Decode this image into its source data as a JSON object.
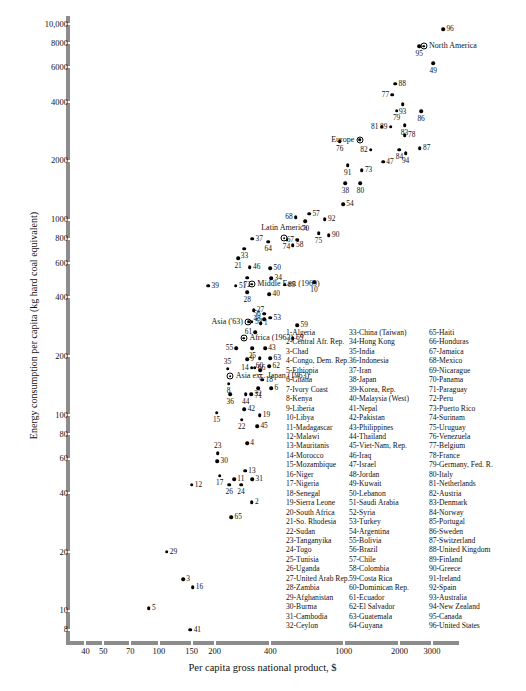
{
  "chart_data": {
    "type": "scatter",
    "title": "",
    "xlabel": "Per capita gross national product, $",
    "ylabel": "Energy consumption per capita (kg hard coal equivalent)",
    "xscale": "log",
    "yscale": "log",
    "xlim": [
      33,
      4200
    ],
    "ylim": [
      7,
      11000
    ],
    "grid": false,
    "legend_position": "inside-lower-right",
    "x_ticks": [
      40,
      50,
      70,
      100,
      150,
      200,
      400,
      1000,
      2000,
      3000
    ],
    "x_tick_labels": [
      "40",
      "50",
      "70",
      "100",
      "150",
      "200",
      "400",
      "1000",
      "2000",
      "3000"
    ],
    "y_ticks": [
      8,
      10,
      20,
      40,
      60,
      80,
      100,
      200,
      400,
      600,
      800,
      1000,
      2000,
      4000,
      6000,
      8000,
      10000
    ],
    "y_tick_labels": [
      "8",
      "10",
      "20",
      "40",
      "60",
      "80",
      "100",
      "200",
      "400",
      "600",
      "800",
      "1000",
      "2000",
      "4000",
      "6000",
      "8000",
      "10,000"
    ],
    "points": [
      {
        "id": "96",
        "x": 3450,
        "y": 9400,
        "lx": "right"
      },
      {
        "id": "95",
        "x": 2560,
        "y": 7700,
        "lx": "below"
      },
      {
        "id": "49",
        "x": 3050,
        "y": 6300,
        "lx": "below"
      },
      {
        "id": "88",
        "x": 1900,
        "y": 4950,
        "lx": "right"
      },
      {
        "id": "77",
        "x": 1830,
        "y": 4350,
        "lx": "left"
      },
      {
        "id": "93",
        "x": 2080,
        "y": 3900,
        "lx": "below"
      },
      {
        "id": "79",
        "x": 1930,
        "y": 3600,
        "lx": "below"
      },
      {
        "id": "86",
        "x": 2620,
        "y": 3580,
        "lx": "below"
      },
      {
        "id": "83",
        "x": 2130,
        "y": 3050,
        "lx": "below"
      },
      {
        "id": "89",
        "x": 1790,
        "y": 2980,
        "lx": "left"
      },
      {
        "id": "81",
        "x": 1600,
        "y": 2980,
        "lx": "left"
      },
      {
        "id": "78",
        "x": 2140,
        "y": 2700,
        "lx": "right"
      },
      {
        "id": "76",
        "x": 950,
        "y": 2520,
        "lx": "below"
      },
      {
        "id": "87",
        "x": 2580,
        "y": 2320,
        "lx": "right"
      },
      {
        "id": "82",
        "x": 1400,
        "y": 2280,
        "lx": "left"
      },
      {
        "id": "84",
        "x": 2000,
        "y": 2280,
        "lx": "below"
      },
      {
        "id": "94",
        "x": 2160,
        "y": 2180,
        "lx": "below"
      },
      {
        "id": "47",
        "x": 1630,
        "y": 1980,
        "lx": "right"
      },
      {
        "id": "91",
        "x": 1050,
        "y": 1900,
        "lx": "below"
      },
      {
        "id": "73",
        "x": 1250,
        "y": 1790,
        "lx": "right"
      },
      {
        "id": "38",
        "x": 1020,
        "y": 1540,
        "lx": "below"
      },
      {
        "id": "80",
        "x": 1230,
        "y": 1540,
        "lx": "below"
      },
      {
        "id": "54",
        "x": 990,
        "y": 1200,
        "lx": "right"
      },
      {
        "id": "68",
        "x": 550,
        "y": 1030,
        "lx": "left"
      },
      {
        "id": "57",
        "x": 650,
        "y": 1070,
        "lx": "right"
      },
      {
        "id": "70",
        "x": 620,
        "y": 985,
        "lx": "below"
      },
      {
        "id": "92",
        "x": 790,
        "y": 1005,
        "lx": "right"
      },
      {
        "id": "75",
        "x": 730,
        "y": 855,
        "lx": "below"
      },
      {
        "id": "90",
        "x": 830,
        "y": 835,
        "lx": "right"
      },
      {
        "id": "67",
        "x": 560,
        "y": 790,
        "lx": "left"
      },
      {
        "id": "74",
        "x": 490,
        "y": 790,
        "lx": "below"
      },
      {
        "id": "37",
        "x": 320,
        "y": 800,
        "lx": "right"
      },
      {
        "id": "64",
        "x": 390,
        "y": 770,
        "lx": "below"
      },
      {
        "id": "58",
        "x": 530,
        "y": 740,
        "lx": "right"
      },
      {
        "id": "33",
        "x": 290,
        "y": 710,
        "lx": "below"
      },
      {
        "id": "21",
        "x": 268,
        "y": 635,
        "lx": "below"
      },
      {
        "id": "46",
        "x": 310,
        "y": 570,
        "lx": "right"
      },
      {
        "id": "50",
        "x": 400,
        "y": 565,
        "lx": "right"
      },
      {
        "id": "72",
        "x": 300,
        "y": 505,
        "lx": "below"
      },
      {
        "id": "34",
        "x": 405,
        "y": 500,
        "lx": "right"
      },
      {
        "id": "85",
        "x": 480,
        "y": 465,
        "lx": "right"
      },
      {
        "id": "10",
        "x": 690,
        "y": 480,
        "lx": "below"
      },
      {
        "id": "39",
        "x": 185,
        "y": 460,
        "lx": "right"
      },
      {
        "id": "51",
        "x": 260,
        "y": 460,
        "lx": "right"
      },
      {
        "id": "28",
        "x": 300,
        "y": 425,
        "lx": "below"
      },
      {
        "id": "40",
        "x": 395,
        "y": 415,
        "lx": "right"
      },
      {
        "id": "27",
        "x": 325,
        "y": 345,
        "lx": "right"
      },
      {
        "id": "56",
        "x": 370,
        "y": 330,
        "lx": "left"
      },
      {
        "id": "53",
        "x": 400,
        "y": 315,
        "lx": "right"
      },
      {
        "id": "48",
        "x": 370,
        "y": 310,
        "lx": "left"
      },
      {
        "id": "52",
        "x": 318,
        "y": 300,
        "lx": "right"
      },
      {
        "id": "1",
        "x": 355,
        "y": 296,
        "lx": "right"
      },
      {
        "id": "59",
        "x": 560,
        "y": 288,
        "lx": "right"
      },
      {
        "id": "61",
        "x": 332,
        "y": 265,
        "lx": "left"
      },
      {
        "id": "69",
        "x": 530,
        "y": 248,
        "lx": "right"
      },
      {
        "id": "55",
        "x": 262,
        "y": 220,
        "lx": "left"
      },
      {
        "id": "25",
        "x": 320,
        "y": 220,
        "lx": "below"
      },
      {
        "id": "43",
        "x": 375,
        "y": 220,
        "lx": "right"
      },
      {
        "id": "60",
        "x": 350,
        "y": 196,
        "lx": "below"
      },
      {
        "id": "63",
        "x": 400,
        "y": 196,
        "lx": "right"
      },
      {
        "id": "9",
        "x": 300,
        "y": 193,
        "lx": "right"
      },
      {
        "id": "62",
        "x": 395,
        "y": 178,
        "lx": "right"
      },
      {
        "id": "7",
        "x": 352,
        "y": 170,
        "lx": "below"
      },
      {
        "id": "66",
        "x": 330,
        "y": 175,
        "lx": "right"
      },
      {
        "id": "14",
        "x": 318,
        "y": 175,
        "lx": "left"
      },
      {
        "id": "35",
        "x": 235,
        "y": 173,
        "lx": "above"
      },
      {
        "id": "18",
        "x": 362,
        "y": 152,
        "lx": "right"
      },
      {
        "id": "8",
        "x": 238,
        "y": 145,
        "lx": "below"
      },
      {
        "id": "71",
        "x": 345,
        "y": 137,
        "lx": "below"
      },
      {
        "id": "6",
        "x": 405,
        "y": 137,
        "lx": "right"
      },
      {
        "id": "36",
        "x": 243,
        "y": 128,
        "lx": "below"
      },
      {
        "id": "44",
        "x": 295,
        "y": 128,
        "lx": "below"
      },
      {
        "id": "32",
        "x": 315,
        "y": 128,
        "lx": "right"
      },
      {
        "id": "42",
        "x": 290,
        "y": 107,
        "lx": "right"
      },
      {
        "id": "15",
        "x": 205,
        "y": 103,
        "lx": "below"
      },
      {
        "id": "19",
        "x": 350,
        "y": 100,
        "lx": "right"
      },
      {
        "id": "22",
        "x": 280,
        "y": 95,
        "lx": "below"
      },
      {
        "id": "45",
        "x": 340,
        "y": 88,
        "lx": "right"
      },
      {
        "id": "4",
        "x": 300,
        "y": 72,
        "lx": "right"
      },
      {
        "id": "23",
        "x": 208,
        "y": 64,
        "lx": "above"
      },
      {
        "id": "30",
        "x": 207,
        "y": 58,
        "lx": "right"
      },
      {
        "id": "13",
        "x": 292,
        "y": 52,
        "lx": "right"
      },
      {
        "id": "17",
        "x": 213,
        "y": 49,
        "lx": "below"
      },
      {
        "id": "11",
        "x": 255,
        "y": 47,
        "lx": "right"
      },
      {
        "id": "31",
        "x": 320,
        "y": 47,
        "lx": "right"
      },
      {
        "id": "24",
        "x": 278,
        "y": 44,
        "lx": "below"
      },
      {
        "id": "26",
        "x": 240,
        "y": 44,
        "lx": "below"
      },
      {
        "id": "12",
        "x": 150,
        "y": 44,
        "lx": "right"
      },
      {
        "id": "2",
        "x": 318,
        "y": 36,
        "lx": "right"
      },
      {
        "id": "65",
        "x": 246,
        "y": 30,
        "lx": "right"
      },
      {
        "id": "29",
        "x": 110,
        "y": 20,
        "lx": "right"
      },
      {
        "id": "3",
        "x": 135,
        "y": 14.5,
        "lx": "right"
      },
      {
        "id": "16",
        "x": 152,
        "y": 13.2,
        "lx": "right"
      },
      {
        "id": "5",
        "x": 88,
        "y": 10.3,
        "lx": "right"
      },
      {
        "id": "41",
        "x": 148,
        "y": 8.0,
        "lx": "right"
      }
    ],
    "aggregates": [
      {
        "label": "North America",
        "x": 2700,
        "y": 7700,
        "lx": "right"
      },
      {
        "label": "Europe",
        "x": 1220,
        "y": 2560,
        "lx": "left"
      },
      {
        "label": "Latin America",
        "x": 476,
        "y": 805,
        "lx": "above"
      },
      {
        "label": "Middle East (1969)",
        "x": 318,
        "y": 468,
        "lx": "right"
      },
      {
        "label": "Asia ('63)",
        "x": 305,
        "y": 300,
        "lx": "left"
      },
      {
        "label": "Africa (1963)",
        "x": 288,
        "y": 248,
        "lx": "right"
      },
      {
        "label": "Asia exc. Japan (1963)",
        "x": 243,
        "y": 158,
        "lx": "right"
      }
    ]
  },
  "legend": {
    "columns": [
      [
        "1-Algeria",
        "2-Central Afr. Rep.",
        "3-Chad",
        "4-Congo, Dem. Rep.",
        "5-Ethiopia",
        "6-Ghana",
        "7-Ivory Coast",
        "8-Kenya",
        "9-Liberia",
        "10-Libya",
        "11-Madagascar",
        "12-Malawi",
        "13-Mauritanis",
        "14-Morocco",
        "15-Mozambique",
        "16-Niger",
        "17-Nigeria",
        "18-Senegal",
        "19-Sierra Leone",
        "20-South Africa",
        "21-So. Rhodesia",
        "22-Sudan",
        "23-Tanganyika",
        "24-Togo",
        "25-Tunisia",
        "26-Uganda",
        "27-United Arab Rep.",
        "28-Zambia",
        "29-Afghanistan",
        "30-Burma",
        "31-Cambodia",
        "32-Ceylon"
      ],
      [
        "33-China (Taiwan)",
        "34-Hong Kong",
        "35-India",
        "36-Indonesia",
        "37-Iran",
        "38-Japan",
        "39-Korea, Rep.",
        "40-Malaysia (West)",
        "41-Nepal",
        "42-Pakistan",
        "43-Philippines",
        "44-Thailand",
        "45-Viet-Nam, Rep.",
        "46-Iraq",
        "47-Israel",
        "48-Jordan",
        "49-Kuwait",
        "50-Lebanon",
        "51-Saudi Arabia",
        "52-Syria",
        "53-Turkey",
        "54-Argentina",
        "55-Bolivia",
        "56-Brazil",
        "57-Chile",
        "58-Colombia",
        "59-Costa Rica",
        "60-Dominican Rep.",
        "61-Ecuador",
        "62-El Salvador",
        "63-Guatemala",
        "64-Guyana"
      ],
      [
        "65-Haiti",
        "66-Honduras",
        "67-Jamaica",
        "68-Mexico",
        "69-Nicarague",
        "70-Panama",
        "71-Paraguay",
        "72-Peru",
        "73-Puerto Rico",
        "74-Surinam",
        "75-Uruguay",
        "76-Venezuela",
        "77-Belgium",
        "78-France",
        "79-Germany, Fed. R.",
        "80-Italy",
        "81-Netherlands",
        "82-Austria",
        "83-Denmark",
        "84-Norway",
        "85-Portugal",
        "86-Sweden",
        "87-Switzerland",
        "88-United Kingdom",
        "89-Finland",
        "90-Greece",
        "91-Ireland",
        "92-Spain",
        "93-Australia",
        "94-New Zealand",
        "95-Canada",
        "96-United States"
      ]
    ]
  },
  "colors": {
    "axis": "#8c8c8c",
    "point": "#000000",
    "text": "#111111",
    "background": "#ffffff"
  }
}
